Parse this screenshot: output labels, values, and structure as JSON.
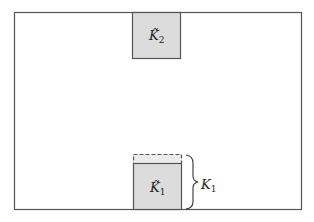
{
  "diagram": {
    "outer_box": {
      "x": 14,
      "y": 12,
      "w": 287,
      "h": 197
    },
    "top_square": {
      "label_main": "K̃",
      "label_sub": "2",
      "x": 132,
      "y": 12,
      "w": 48,
      "h": 46,
      "fill": "#dcdcdc"
    },
    "bottom_square": {
      "label_main": "K̃",
      "label_sub": "1",
      "x": 133,
      "y": 163,
      "w": 48,
      "h": 46,
      "fill": "#dcdcdc"
    },
    "dashed_extension": {
      "x": 133,
      "y": 154,
      "w": 48,
      "h": 9
    },
    "brace_label": {
      "main": "K",
      "sub": "1"
    },
    "colors": {
      "stroke": "#555555",
      "fill": "#dcdcdc",
      "text": "#222222"
    }
  }
}
